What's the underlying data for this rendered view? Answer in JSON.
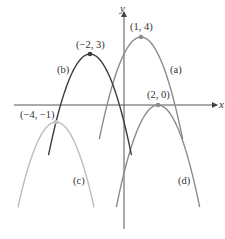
{
  "chart_data": {
    "type": "line",
    "title": "",
    "xlabel": "x",
    "ylabel": "y",
    "grid": false,
    "series": [
      {
        "name": "(a)",
        "equation": "y = -(x - 1)^2 + 4",
        "vertex": {
          "x": 1,
          "y": 4,
          "label": "(1, 4)"
        },
        "x_range": [
          -1.45,
          3.45
        ],
        "color": "#8c8c8c"
      },
      {
        "name": "(b)",
        "equation": "y = -(x + 2)^2 + 3",
        "vertex": {
          "x": -2,
          "y": 3,
          "label": "(−2, 3)"
        },
        "x_range": [
          -4.44,
          0.44
        ],
        "color": "#3c3c3c"
      },
      {
        "name": "(c)",
        "equation": "y = -(x + 4)^2 - 1",
        "vertex": {
          "x": -4,
          "y": -1,
          "label": "(−4, −1)"
        },
        "x_range": [
          -6.24,
          -1.76
        ],
        "color": "#bdbdbd"
      },
      {
        "name": "(d)",
        "equation": "y = -(x - 2)^2",
        "vertex": {
          "x": 2,
          "y": 0,
          "label": "(2, 0)"
        },
        "x_range": [
          -0.45,
          4.45
        ],
        "color": "#8c8c8c"
      }
    ]
  },
  "axes": {
    "x_label": "x",
    "y_label": "y",
    "color": "#444444"
  },
  "curve_labels": {
    "a": "(a)",
    "b": "(b)",
    "c": "(c)",
    "d": "(d)"
  },
  "vertex_labels": {
    "a": "(1, 4)",
    "b": "(−2, 3)",
    "c": "(−4, −1)",
    "d": "(2, 0)"
  }
}
